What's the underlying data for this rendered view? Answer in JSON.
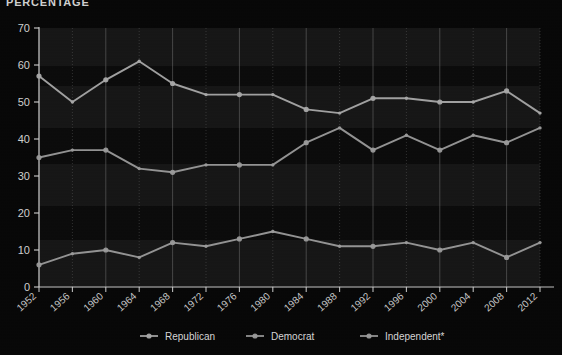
{
  "title": "PERCENTAGE",
  "legend": {
    "position": "bottom",
    "items": [
      {
        "label": "Republican",
        "color": "#a8a8a8"
      },
      {
        "label": "Democrat",
        "color": "#9a9a9a"
      },
      {
        "label": "Independent*",
        "color": "#9a9a9a"
      }
    ]
  },
  "axes": {
    "y_ticks": [
      "0",
      "10",
      "20",
      "30",
      "40",
      "50",
      "60",
      "70"
    ],
    "x_ticks": [
      "1952",
      "1956",
      "1960",
      "1964",
      "1968",
      "1972",
      "1976",
      "1980",
      "1984",
      "1988",
      "1992",
      "1996",
      "2000",
      "2004",
      "2008",
      "2012"
    ]
  },
  "colors": {
    "background": "#060606",
    "plot_background": "#0a0a0a",
    "axis": "#cfcfcf",
    "gridline": "#6d6d6d",
    "band": "#4b4b4b",
    "republican": "#a8a8a8",
    "democrat": "#9a9a9a",
    "independent": "#9a9a9a"
  },
  "chart_data": {
    "type": "line",
    "title": "PERCENTAGE",
    "xlabel": "",
    "ylabel": "PERCENTAGE",
    "ylim": [
      0,
      70
    ],
    "grid": true,
    "legend_position": "bottom",
    "categories": [
      "1952",
      "1956",
      "1960",
      "1964",
      "1968",
      "1972",
      "1976",
      "1980",
      "1984",
      "1988",
      "1992",
      "1996",
      "2000",
      "2004",
      "2008",
      "2012"
    ],
    "series": [
      {
        "name": "Republican",
        "values": [
          57,
          50,
          56,
          61,
          55,
          52,
          52,
          52,
          48,
          47,
          51,
          51,
          50,
          50,
          53,
          47
        ]
      },
      {
        "name": "Democrat",
        "values": [
          35,
          37,
          37,
          32,
          31,
          33,
          33,
          33,
          39,
          43,
          37,
          41,
          37,
          41,
          39,
          43
        ]
      },
      {
        "name": "Independent*",
        "values": [
          6,
          9,
          10,
          8,
          12,
          11,
          13,
          15,
          13,
          11,
          11,
          12,
          10,
          12,
          8,
          12
        ]
      }
    ]
  }
}
